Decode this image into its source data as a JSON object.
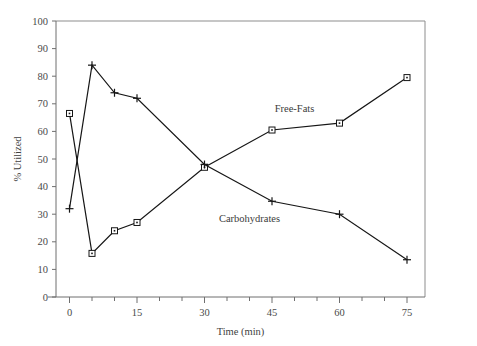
{
  "chart_data": {
    "type": "line",
    "title": "",
    "xlabel": "Time (min)",
    "ylabel": "% Utilized",
    "xlim": [
      -3,
      79
    ],
    "ylim": [
      0,
      100
    ],
    "x_ticks_major": [
      0,
      15,
      30,
      45,
      60,
      75
    ],
    "x_ticks_minor": [
      5,
      10,
      20,
      25,
      35,
      40,
      50,
      55,
      65,
      70
    ],
    "y_ticks": [
      0,
      10,
      20,
      30,
      40,
      50,
      60,
      70,
      80,
      90,
      100
    ],
    "grid": false,
    "legend_position": "inline-annotations",
    "x": [
      0,
      5,
      10,
      15,
      30,
      45,
      60,
      75
    ],
    "series": [
      {
        "name": "Free-Fats",
        "marker": "square",
        "label_text": "Free-Fats",
        "values": [
          66.5,
          15.8,
          24.0,
          27.0,
          47.0,
          60.5,
          63.0,
          79.5
        ]
      },
      {
        "name": "Carbohydrates",
        "marker": "plus",
        "label_text": "Carbohydrates",
        "values": [
          32.0,
          84.0,
          74.0,
          72.0,
          48.0,
          34.7,
          30.0,
          13.5
        ]
      }
    ],
    "annotations": [
      {
        "text": "Free-Fats",
        "x": 50,
        "y": 67
      },
      {
        "text": "Carbohydrates",
        "x": 40,
        "y": 27
      }
    ]
  },
  "colors": {
    "line": "#161616",
    "frame": "#8d8d8d",
    "axis": "#6f6f6f",
    "text": "#3a3a3a",
    "background": "#ffffff"
  },
  "axis_tick_labels": {
    "y": [
      "100",
      "90",
      "80",
      "70",
      "60",
      "50",
      "40",
      "30",
      "20",
      "10",
      "0"
    ],
    "x": [
      "0",
      "15",
      "30",
      "45",
      "60",
      "75"
    ]
  }
}
